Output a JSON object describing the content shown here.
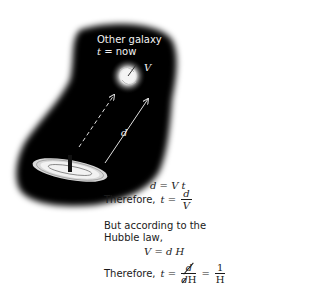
{
  "diagram": {
    "other_galaxy": {
      "title": "Other galaxy",
      "time_var": "t",
      "time_eq": " = now",
      "velocity_label": "V"
    },
    "distance_label": "d",
    "colors": {
      "space": "#000000",
      "galaxy_glow": "#e6e6e6",
      "text_light": "#f2f2f2",
      "text_dark": "#1a1a1a",
      "background": "#ffffff"
    }
  },
  "equations": {
    "eq1": "d = V t",
    "therefore1_prefix": "Therefore,",
    "therefore1_lhs": "t =",
    "therefore1_num": "d",
    "therefore1_den": "V",
    "hubble_line1": "But according to the",
    "hubble_line2": "Hubble law,",
    "eq2": "V = d H",
    "therefore2_prefix": "Therefore,",
    "therefore2_lhs": "t =",
    "therefore2_num": "d",
    "therefore2_den_cancel": "d",
    "therefore2_den_rest": "H",
    "therefore2_eq": "=",
    "therefore2_num2": "1",
    "therefore2_den2": "H"
  }
}
